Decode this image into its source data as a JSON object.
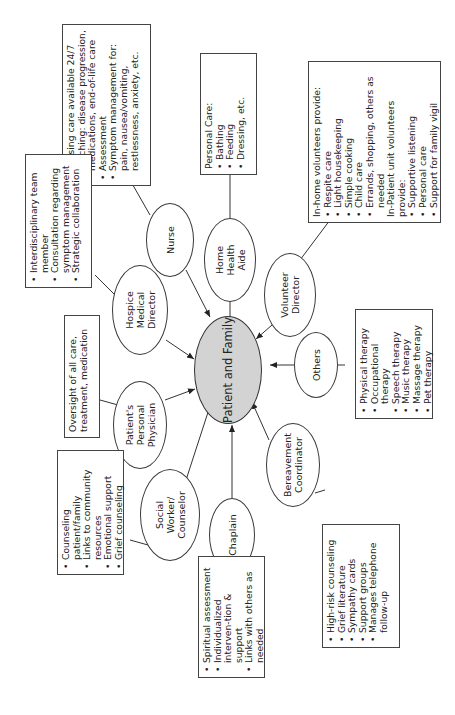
{
  "center": {
    "label": "Patient and Family",
    "fill": "#d3d3d3"
  },
  "roles": [
    {
      "id": "nurse",
      "label": "Nurse",
      "details": {
        "items": [
          "Nursing care available 24/7",
          "Teaching: disease progression, medications, end-of-life care",
          "Assessment",
          "Symptom management for: pain, nausea/vomiting, restlessness, anxiety, etc."
        ]
      }
    },
    {
      "id": "home-health-aide",
      "label": "Home Health Aide",
      "details": {
        "heading": "Personal Care:",
        "items": [
          "Bathing",
          "Feeding",
          "Dressing, etc."
        ]
      }
    },
    {
      "id": "volunteer-director",
      "label": "Volunteer Director",
      "details": {
        "heading": "In-home volunteers provide:",
        "items": [
          "Respite care",
          "Light housekeeping",
          "Simple cooking",
          "Child care",
          "Errands, shopping, others as needed"
        ],
        "heading2": "In-Patient unit volunteers provide:",
        "items2": [
          "Supportive listening",
          "Personal care",
          "Support for family vigil"
        ]
      }
    },
    {
      "id": "hospice-medical-director",
      "label": "Hospice Medical Director",
      "details": {
        "items": [
          "Interdisciplinary team member",
          "Consultation regarding symptom management",
          "Strategic collaboration"
        ]
      }
    },
    {
      "id": "personal-physician",
      "label": "Patient's Personal Physician",
      "details": {
        "text": "Oversight of all care, treatment, medication"
      }
    },
    {
      "id": "social-worker",
      "label": "Social Worker/ Counselor",
      "details": {
        "items": [
          "Counseling patient/family",
          "Links to community resources",
          "Emotional support",
          "Grief counseling"
        ]
      }
    },
    {
      "id": "chaplain",
      "label": "Chaplain",
      "details": {
        "items": [
          "Spiritual assessment",
          "Individualized interven-tion & support",
          "Links with others as needed"
        ]
      }
    },
    {
      "id": "bereavement-coordinator",
      "label": "Bereavement Coordinator",
      "details": {
        "items": [
          "High-risk counseling",
          "Grief literature",
          "Sympathy cards",
          "Support groups",
          "Manages telephone follow-up"
        ]
      }
    },
    {
      "id": "others",
      "label": "Others",
      "details": {
        "items": [
          "Physical therapy",
          "Occupational therapy",
          "Speech therapy",
          "Music therapy",
          "Massage therapy",
          "Pet therapy"
        ]
      }
    }
  ]
}
